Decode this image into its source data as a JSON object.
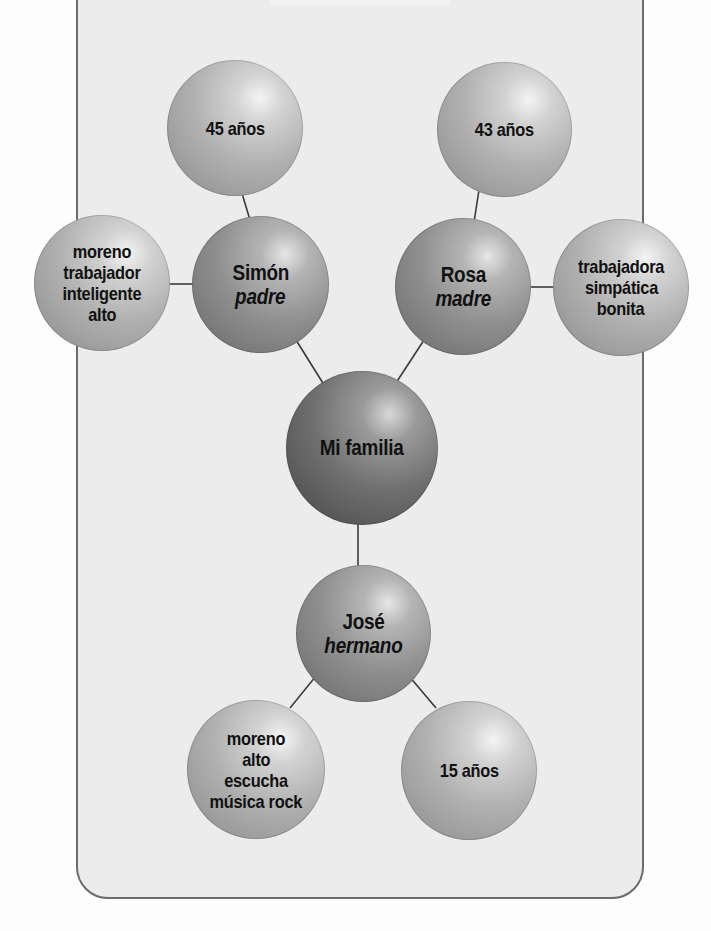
{
  "diagram": {
    "title": "Mi familia",
    "colors": {
      "panel_bg": "#ececec",
      "panel_border": "#6a6a6a",
      "connector": "#3a3a3a",
      "page_bg": "#fdfdfd"
    },
    "center": {
      "label": "Mi familia"
    },
    "nodes": {
      "simon": {
        "name": "Simón",
        "role": "padre"
      },
      "simon_age": {
        "lines": [
          "45 años"
        ]
      },
      "simon_traits": {
        "lines": [
          "moreno",
          "trabajador",
          "inteligente",
          "alto"
        ]
      },
      "rosa": {
        "name": "Rosa",
        "role": "madre"
      },
      "rosa_age": {
        "lines": [
          "43 años"
        ]
      },
      "rosa_traits": {
        "lines": [
          "trabajadora",
          "simpática",
          "bonita"
        ]
      },
      "jose": {
        "name": "José",
        "role": "hermano"
      },
      "jose_traits": {
        "lines": [
          "moreno",
          "alto",
          "escucha",
          "música rock"
        ]
      },
      "jose_age": {
        "lines": [
          "15 años"
        ]
      }
    },
    "edges": [
      [
        "simon_age",
        "simon"
      ],
      [
        "simon_traits",
        "simon"
      ],
      [
        "simon",
        "center"
      ],
      [
        "rosa_age",
        "rosa"
      ],
      [
        "rosa",
        "rosa_traits"
      ],
      [
        "rosa",
        "center"
      ],
      [
        "center",
        "jose"
      ],
      [
        "jose",
        "jose_traits"
      ],
      [
        "jose",
        "jose_age"
      ]
    ]
  }
}
